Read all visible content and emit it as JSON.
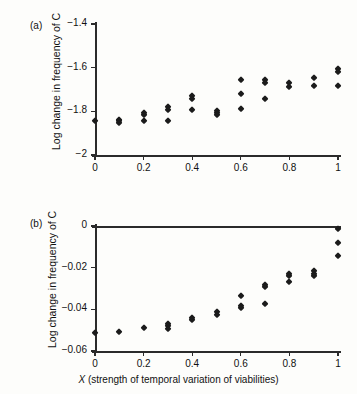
{
  "figure": {
    "panel_a_label": "(a)",
    "panel_b_label": "(b)",
    "xcaption_symbol": "X",
    "xcaption_rest": " (strength of temporal variation of viabilities)"
  },
  "chart_data": [
    {
      "type": "scatter",
      "panel": "(a)",
      "title": "",
      "xlabel": "X (strength of temporal variation of viabilities)",
      "ylabel": "Log change in frequency of C",
      "xlim": [
        0,
        1
      ],
      "ylim": [
        -2,
        -1.4
      ],
      "xticks": [
        0,
        0.2,
        0.4,
        0.6,
        0.8,
        1
      ],
      "xticklabels": [
        "0",
        "0.2",
        "0.4",
        "0.6",
        "0.8",
        "1"
      ],
      "yticks": [
        -1.4,
        -1.6,
        -1.8,
        -2
      ],
      "yticklabels": [
        "-1.4",
        "-1.6",
        "-1.8",
        "-2"
      ],
      "minor_xticks": [
        0.1,
        0.3,
        0.5,
        0.7,
        0.9
      ],
      "grid": false,
      "legend": null,
      "marker": "diamond",
      "marker_color": "#1b1b1b",
      "points": [
        {
          "x": 0.0,
          "y": -1.845
        },
        {
          "x": 0.1,
          "y": -1.838
        },
        {
          "x": 0.1,
          "y": -1.845
        },
        {
          "x": 0.1,
          "y": -1.852
        },
        {
          "x": 0.2,
          "y": -1.808
        },
        {
          "x": 0.2,
          "y": -1.815
        },
        {
          "x": 0.2,
          "y": -1.845
        },
        {
          "x": 0.3,
          "y": -1.782
        },
        {
          "x": 0.3,
          "y": -1.795
        },
        {
          "x": 0.3,
          "y": -1.845
        },
        {
          "x": 0.4,
          "y": -1.728
        },
        {
          "x": 0.4,
          "y": -1.742
        },
        {
          "x": 0.4,
          "y": -1.792
        },
        {
          "x": 0.5,
          "y": -1.8
        },
        {
          "x": 0.5,
          "y": -1.808
        },
        {
          "x": 0.5,
          "y": -1.815
        },
        {
          "x": 0.6,
          "y": -1.655
        },
        {
          "x": 0.6,
          "y": -1.722
        },
        {
          "x": 0.6,
          "y": -1.788
        },
        {
          "x": 0.7,
          "y": -1.658
        },
        {
          "x": 0.7,
          "y": -1.668
        },
        {
          "x": 0.7,
          "y": -1.742
        },
        {
          "x": 0.8,
          "y": -1.668
        },
        {
          "x": 0.8,
          "y": -1.688
        },
        {
          "x": 0.9,
          "y": -1.648
        },
        {
          "x": 0.9,
          "y": -1.685
        },
        {
          "x": 1.0,
          "y": -1.608
        },
        {
          "x": 1.0,
          "y": -1.622
        },
        {
          "x": 1.0,
          "y": -1.682
        }
      ]
    },
    {
      "type": "scatter",
      "panel": "(b)",
      "title": "",
      "xlabel": "X (strength of temporal variation of viabilities)",
      "ylabel": "Log change in frequency of C",
      "xlim": [
        0,
        1
      ],
      "ylim": [
        -0.06,
        0
      ],
      "xticks": [
        0,
        0.2,
        0.4,
        0.6,
        0.8,
        1
      ],
      "xticklabels": [
        "0",
        "0.2",
        "0.4",
        "0.6",
        "0.8",
        "1"
      ],
      "yticks": [
        0,
        -0.02,
        -0.04,
        -0.06
      ],
      "yticklabels": [
        "0",
        "-0.02",
        "-0.04",
        "-0.06"
      ],
      "minor_xticks": [
        0.1,
        0.3,
        0.5,
        0.7,
        0.9
      ],
      "grid": false,
      "legend": null,
      "marker": "diamond",
      "marker_color": "#1b1b1b",
      "points": [
        {
          "x": 0.0,
          "y": -0.0512
        },
        {
          "x": 0.1,
          "y": -0.0508
        },
        {
          "x": 0.2,
          "y": -0.0488
        },
        {
          "x": 0.3,
          "y": -0.0468
        },
        {
          "x": 0.3,
          "y": -0.0478
        },
        {
          "x": 0.3,
          "y": -0.0492
        },
        {
          "x": 0.4,
          "y": -0.0442
        },
        {
          "x": 0.4,
          "y": -0.0452
        },
        {
          "x": 0.5,
          "y": -0.0415
        },
        {
          "x": 0.5,
          "y": -0.0425
        },
        {
          "x": 0.6,
          "y": -0.0338
        },
        {
          "x": 0.6,
          "y": -0.0382
        },
        {
          "x": 0.6,
          "y": -0.0392
        },
        {
          "x": 0.7,
          "y": -0.0282
        },
        {
          "x": 0.7,
          "y": -0.0292
        },
        {
          "x": 0.7,
          "y": -0.0372
        },
        {
          "x": 0.8,
          "y": -0.0228
        },
        {
          "x": 0.8,
          "y": -0.0238
        },
        {
          "x": 0.8,
          "y": -0.0268
        },
        {
          "x": 0.9,
          "y": -0.0215
        },
        {
          "x": 0.9,
          "y": -0.0228
        },
        {
          "x": 0.9,
          "y": -0.0242
        },
        {
          "x": 1.0,
          "y": -0.0015
        },
        {
          "x": 1.0,
          "y": -0.0082
        },
        {
          "x": 1.0,
          "y": -0.0142
        }
      ]
    }
  ]
}
